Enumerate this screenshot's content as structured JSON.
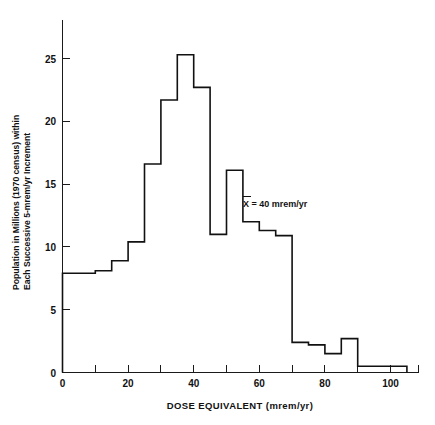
{
  "chart_data": {
    "type": "bar",
    "subtype": "step-histogram",
    "title": "",
    "xlabel": "DOSE EQUIVALENT (mrem/yr)",
    "ylabel": "Population in Millions (1970 census) within Each Successive 5-mrem/yr Increment",
    "ylabel_line1": "Population in Millions (1970 census) within",
    "ylabel_line2": "Each Successive 5-mrem/yr Increment",
    "xlim": [
      0,
      110
    ],
    "ylim": [
      0,
      28
    ],
    "xticks_major": [
      0,
      20,
      40,
      60,
      80,
      100
    ],
    "xticks_minor": [
      10,
      30,
      50,
      70,
      90
    ],
    "xtick_labels": [
      "0",
      "20",
      "40",
      "60",
      "80",
      "100"
    ],
    "yticks": [
      0,
      5,
      10,
      15,
      20,
      25
    ],
    "ytick_labels": [
      "0",
      "5",
      "10",
      "15",
      "20",
      "25"
    ],
    "grid": false,
    "legend": false,
    "bin_width": 5,
    "bin_edges": [
      0,
      5,
      10,
      15,
      20,
      25,
      30,
      35,
      40,
      45,
      50,
      55,
      60,
      65,
      70,
      75,
      80,
      85,
      90,
      95,
      100,
      105
    ],
    "categories": [
      "0-5",
      "5-10",
      "10-15",
      "15-20",
      "20-25",
      "25-30",
      "30-35",
      "35-40",
      "40-45",
      "45-50",
      "50-55",
      "55-60",
      "60-65",
      "65-70",
      "70-75",
      "75-80",
      "80-85",
      "85-90",
      "90-95",
      "95-100",
      "100-105"
    ],
    "values": [
      7.9,
      7.9,
      8.1,
      8.9,
      10.4,
      16.6,
      21.7,
      25.3,
      22.7,
      11.0,
      16.1,
      12.0,
      11.3,
      10.9,
      2.4,
      2.2,
      1.5,
      2.7,
      0.5,
      0.5,
      0.5
    ],
    "annotations": [
      {
        "name": "mean-annotation",
        "text": "X = 40 mrem/yr",
        "symbol": "X-bar",
        "value": 40,
        "unit": "mrem/yr",
        "x": 57,
        "y": 14.2
      }
    ]
  },
  "axes": {
    "x_title": "DOSE EQUIVALENT (mrem/yr)",
    "y_title_line1": "Population in Millions (1970 census) within",
    "y_title_line2": "Each Successive 5-mrem/yr Increment"
  }
}
